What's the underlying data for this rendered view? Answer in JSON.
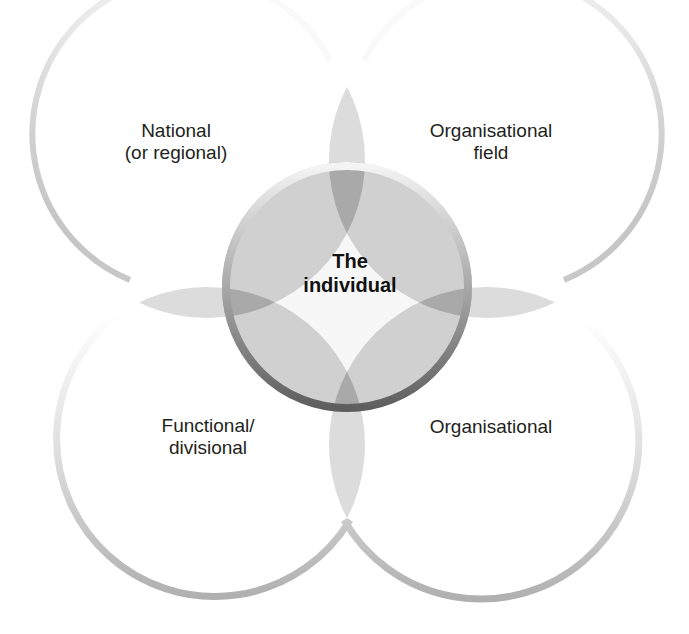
{
  "diagram": {
    "type": "overlapping-circles",
    "center": {
      "label_line1": "The",
      "label_line2": "individual"
    },
    "circles": [
      {
        "position": "top-left",
        "label_line1": "National",
        "label_line2": "(or regional)"
      },
      {
        "position": "top-right",
        "label_line1": "Organisational",
        "label_line2": "field"
      },
      {
        "position": "bottom-left",
        "label_line1": "Functional/",
        "label_line2": "divisional"
      },
      {
        "position": "bottom-right",
        "label_line1": "Organisational",
        "label_line2": ""
      }
    ],
    "colors": {
      "overlap_fill": "#d4d4d4",
      "double_overlap": "#a9a9a9",
      "center_ring": "#6e6e6e",
      "arc": "#c0c0c0",
      "text": "#231f20"
    }
  }
}
